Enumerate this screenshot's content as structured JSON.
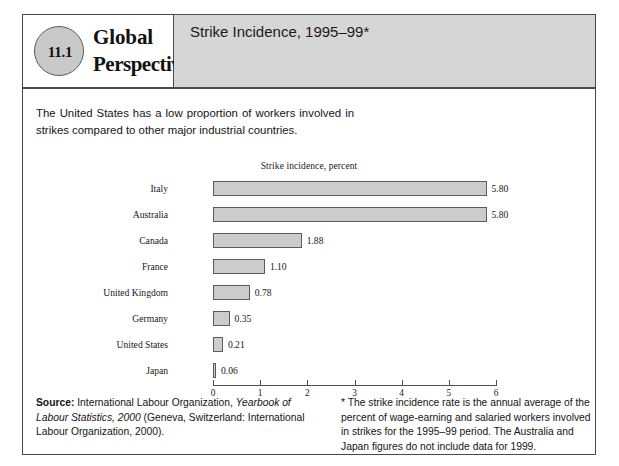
{
  "figure": {
    "badge_number": "11.1",
    "brand_line1": "Global",
    "brand_line2": "Perspective",
    "title": "Strike Incidence, 1995–99*",
    "intro": "The United States has a low proportion of workers involved in strikes compared to other major industrial countries.",
    "source_label": "Source:",
    "source_text_1": " International Labour Organization, ",
    "source_italic": "Yearbook of Labour Statistics, 2000",
    "source_text_2": " (Geneva, Switzerland: International Labour Organization, 2000).",
    "footnote": "* The strike incidence rate is the annual average of the percent of wage-earning and salaried workers involved in strikes for the 1995–99 period. The Australia and Japan figures do not include data for 1999."
  },
  "chart_data": {
    "type": "bar",
    "orientation": "horizontal",
    "title": "Strike incidence, percent",
    "xlabel": "",
    "ylabel": "",
    "xlim": [
      0,
      6
    ],
    "xticks": [
      0,
      1,
      2,
      3,
      4,
      5,
      6
    ],
    "xtick_labels": [
      "0",
      "1",
      "2",
      "3",
      "4",
      "5",
      "6"
    ],
    "grid": false,
    "legend": false,
    "categories": [
      "Italy",
      "Australia",
      "Canada",
      "France",
      "United Kingdom",
      "Germany",
      "United States",
      "Japan"
    ],
    "values": [
      5.8,
      5.8,
      1.88,
      1.1,
      0.78,
      0.35,
      0.21,
      0.06
    ],
    "value_labels": [
      "5.80",
      "5.80",
      "1.88",
      "1.10",
      "0.78",
      "0.35",
      "0.21",
      "0.06"
    ],
    "bar_color": "#cccccc",
    "bar_border_color": "#5c5c5c"
  }
}
